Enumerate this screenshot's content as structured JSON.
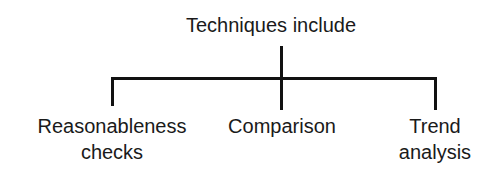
{
  "diagram": {
    "root": {
      "label": "Techniques include"
    },
    "children": [
      {
        "label": "Reasonableness\nchecks"
      },
      {
        "label": "Comparison"
      },
      {
        "label": "Trend\nanalysis"
      }
    ],
    "colors": {
      "line": "#111111",
      "text": "#1a1a1a",
      "background": "#ffffff"
    }
  }
}
